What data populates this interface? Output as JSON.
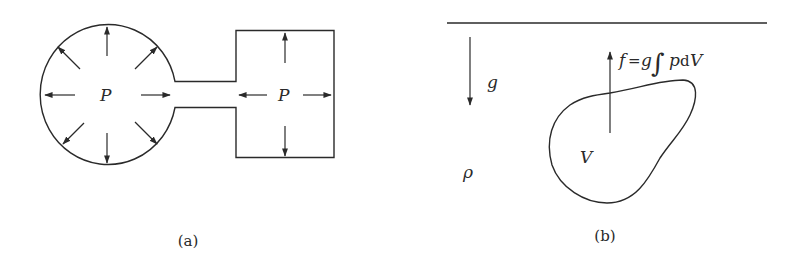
{
  "figure_a": {
    "caption": "(a)",
    "left_label": "P",
    "right_label": "P"
  },
  "figure_b": {
    "caption": "(b)",
    "gravity_label": "g",
    "density_label": "ρ",
    "volume_label": "V",
    "force_f": "f",
    "force_eq": "=",
    "force_g": "g",
    "force_integral": "∫",
    "force_p": "p",
    "force_d": "d",
    "force_v": "V"
  }
}
